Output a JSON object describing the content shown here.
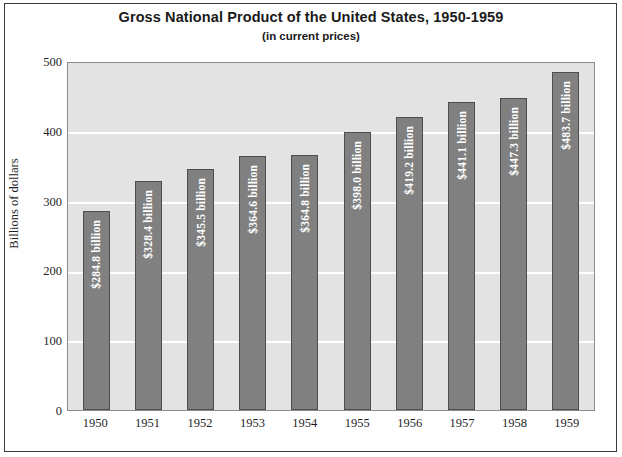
{
  "chart_data": {
    "type": "bar",
    "title": "Gross National Product of the United States, 1950-1959",
    "subtitle": "(in current prices)",
    "xlabel": "",
    "ylabel": "Billions of dollars",
    "ylim": [
      0,
      500
    ],
    "yticks": [
      0,
      100,
      200,
      300,
      400,
      500
    ],
    "ytick_labels": [
      "0",
      "100",
      "200",
      "300",
      "400",
      "500"
    ],
    "grid": true,
    "legend": false,
    "categories": [
      "1950",
      "1951",
      "1952",
      "1953",
      "1954",
      "1955",
      "1956",
      "1957",
      "1958",
      "1959"
    ],
    "values": [
      284.8,
      328.4,
      345.5,
      364.6,
      364.8,
      398.0,
      419.2,
      441.1,
      447.3,
      483.7
    ],
    "data_labels": [
      "$284.8 billion",
      "$328.4 billion",
      "$345.5 billion",
      "$364.6 billion",
      "$364.8 billion",
      "$398.0 billion",
      "$419.2 billion",
      "$441.1 billion",
      "$447.3 billion",
      "$483.7 billion"
    ],
    "colors": {
      "bar_fill": "#808080",
      "bar_edge": "#4d4d4d",
      "plot_background": "#e3e3e3",
      "gridline": "#ffffff",
      "label_text": "#ffffff",
      "frame": "#3a3a3a"
    }
  }
}
